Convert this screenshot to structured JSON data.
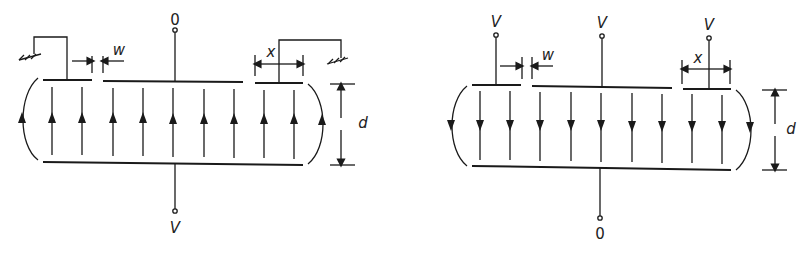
{
  "colors": {
    "ink": "#1a1a1a",
    "background": "#ffffff"
  },
  "left_diagram": {
    "description": "Parallel plate electrodes with grounded guard rings, field lines pointing up",
    "top_terminal_label": "0",
    "bottom_terminal_label": "V",
    "gap_label": "w",
    "guard_width_label": "x",
    "separation_label": "d",
    "field_direction": "up",
    "guard_connection": "ground"
  },
  "right_diagram": {
    "description": "Parallel plate electrodes with guard rings held at V, field lines pointing down",
    "top_left_label": "V",
    "top_center_label": "V",
    "top_right_label": "V",
    "bottom_terminal_label": "0",
    "gap_label": "w",
    "guard_width_label": "x",
    "separation_label": "d",
    "field_direction": "down"
  }
}
